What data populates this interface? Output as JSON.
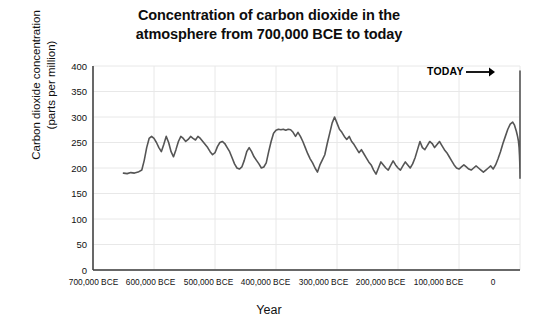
{
  "chart_data": {
    "type": "line",
    "title": "Concentration of carbon dioxide in the atmosphere from 700,000 BCE to today",
    "title_line1": "Concentration of carbon dioxide in the",
    "title_line2": "atmosphere from 700,000 BCE to today",
    "xlabel": "Year",
    "ylabel": "Carbon dioxide concentration (parts per million)",
    "ylabel_line1": "Carbon dioxide concentration",
    "ylabel_line2": "(parts per million)",
    "xlim": [
      -700000,
      0
    ],
    "ylim": [
      0,
      400
    ],
    "yticks": [
      0,
      50,
      100,
      150,
      200,
      250,
      300,
      350,
      400
    ],
    "ytick_labels": [
      "0",
      "50",
      "100",
      "150",
      "200",
      "250",
      "300",
      "350",
      "400"
    ],
    "xticks": [
      -700000,
      -600000,
      -500000,
      -400000,
      -300000,
      -200000,
      -100000,
      0
    ],
    "xtick_labels": [
      "700,000 BCE",
      "600,000 BCE",
      "500,000 BCE",
      "400,000 BCE",
      "300,000 BCE",
      "200,000 BCE",
      "100,000 BCE",
      "0"
    ],
    "grid": true,
    "grid_color": "#e8e8e8",
    "axis_color": "#3a3a3a",
    "line_color": "#555555",
    "line_width": 1.6,
    "legend": null,
    "annotations": [
      {
        "text": "TODAY",
        "arrow": "→",
        "points_to_x": -1000,
        "points_to_y": 390
      }
    ],
    "series": [
      {
        "name": "Atmospheric CO2",
        "units": "ppm",
        "x": [
          -650000,
          -644000,
          -638000,
          -632000,
          -626000,
          -620000,
          -616000,
          -612000,
          -608000,
          -604000,
          -600000,
          -596000,
          -592000,
          -588000,
          -584000,
          -580000,
          -576000,
          -572000,
          -568000,
          -564000,
          -560000,
          -556000,
          -552000,
          -548000,
          -544000,
          -540000,
          -536000,
          -532000,
          -528000,
          -524000,
          -520000,
          -516000,
          -512000,
          -508000,
          -504000,
          -500000,
          -496000,
          -492000,
          -488000,
          -484000,
          -480000,
          -476000,
          -472000,
          -468000,
          -464000,
          -460000,
          -456000,
          -452000,
          -448000,
          -444000,
          -440000,
          -436000,
          -432000,
          -428000,
          -424000,
          -420000,
          -416000,
          -412000,
          -408000,
          -404000,
          -400000,
          -396000,
          -392000,
          -388000,
          -384000,
          -380000,
          -376000,
          -372000,
          -368000,
          -364000,
          -360000,
          -356000,
          -352000,
          -348000,
          -344000,
          -340000,
          -336000,
          -332000,
          -328000,
          -324000,
          -320000,
          -316000,
          -312000,
          -308000,
          -304000,
          -300000,
          -296000,
          -292000,
          -288000,
          -284000,
          -280000,
          -276000,
          -272000,
          -268000,
          -264000,
          -260000,
          -256000,
          -252000,
          -248000,
          -244000,
          -240000,
          -236000,
          -232000,
          -228000,
          -224000,
          -220000,
          -216000,
          -212000,
          -208000,
          -204000,
          -200000,
          -196000,
          -192000,
          -188000,
          -184000,
          -180000,
          -176000,
          -172000,
          -168000,
          -164000,
          -160000,
          -156000,
          -152000,
          -148000,
          -144000,
          -140000,
          -136000,
          -132000,
          -128000,
          -124000,
          -120000,
          -116000,
          -112000,
          -108000,
          -104000,
          -100000,
          -96000,
          -92000,
          -88000,
          -84000,
          -80000,
          -76000,
          -72000,
          -68000,
          -64000,
          -60000,
          -56000,
          -52000,
          -48000,
          -44000,
          -40000,
          -36000,
          -32000,
          -28000,
          -24000,
          -20000,
          -16000,
          -12000,
          -9000,
          -6000,
          -4000,
          -2500,
          -1500,
          -800,
          -400,
          -200,
          -100,
          -50,
          -20,
          0
        ],
        "values": [
          190,
          189,
          191,
          190,
          192,
          196,
          215,
          240,
          258,
          262,
          258,
          250,
          240,
          232,
          246,
          262,
          250,
          232,
          222,
          236,
          252,
          262,
          258,
          252,
          256,
          262,
          258,
          255,
          262,
          258,
          252,
          246,
          240,
          232,
          226,
          230,
          242,
          250,
          252,
          248,
          240,
          232,
          220,
          208,
          200,
          198,
          202,
          215,
          232,
          240,
          232,
          222,
          215,
          208,
          200,
          202,
          210,
          232,
          252,
          268,
          274,
          276,
          275,
          276,
          274,
          276,
          275,
          270,
          262,
          270,
          262,
          252,
          240,
          228,
          218,
          210,
          200,
          192,
          206,
          216,
          226,
          248,
          268,
          288,
          300,
          288,
          276,
          270,
          262,
          256,
          262,
          252,
          246,
          238,
          230,
          236,
          228,
          220,
          212,
          206,
          196,
          188,
          200,
          212,
          206,
          200,
          196,
          205,
          214,
          206,
          200,
          196,
          204,
          212,
          206,
          200,
          208,
          220,
          236,
          252,
          240,
          236,
          244,
          252,
          248,
          240,
          246,
          252,
          244,
          236,
          230,
          222,
          214,
          206,
          200,
          198,
          202,
          206,
          202,
          198,
          196,
          200,
          204,
          200,
          196,
          192,
          196,
          200,
          204,
          198,
          206,
          218,
          232,
          248,
          262,
          276,
          286,
          290,
          284,
          272,
          262,
          252,
          240,
          224,
          212,
          200,
          192,
          186,
          182,
          180
        ],
        "modern_spike_x": [
          0,
          0,
          0,
          0
        ],
        "modern_spike_values": [
          180,
          200,
          280,
          390
        ]
      }
    ]
  },
  "annotation_today": {
    "label": "TODAY",
    "arrow_glyph": "→"
  }
}
